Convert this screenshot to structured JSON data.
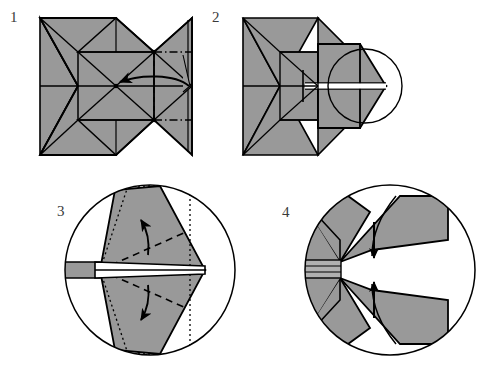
{
  "document": {
    "title": "Origami folding instruction diagram",
    "type": "step-by-step fold sequence",
    "panel_count": 4,
    "width": 485,
    "height": 370,
    "background_color": "#ffffff"
  },
  "colors": {
    "paper_gray": "#999999",
    "paper_gray_light": "#b0b0b0",
    "outline": "#000000",
    "label_text": "#3a3a3a",
    "white": "#ffffff"
  },
  "panels": [
    {
      "id": "panel-1",
      "number": "1",
      "label_x": 10,
      "label_y": 22,
      "caption": "Flat crease pattern of folded square grid with valley fold and arrow indicating fold to the left",
      "has_magnifier_circle": false,
      "annotations": {
        "valley_fold_vertical": "dashed vertical line",
        "dash_dot_lines": "two horizontal dash-dot fold lines on right",
        "arrow": "curved arrow pointing left"
      }
    },
    {
      "id": "panel-2",
      "number": "2",
      "label_x": 212,
      "label_y": 22,
      "caption": "Resulting collapsed form with circular magnifier highlighting the point",
      "has_magnifier_circle": true,
      "annotations": {
        "magnifier": "circle outlining the tip region to be enlarged in step 3"
      }
    },
    {
      "id": "panel-3",
      "number": "3",
      "label_x": 57,
      "label_y": 216,
      "caption": "Enlarged view inside circle; dotted square outline, dashed fold lines and two curved arrows opening the flaps outward",
      "has_magnifier_circle": true,
      "annotations": {
        "dotted_outline": "dotted square reference outline",
        "dashed_folds": "two dashed fold lines",
        "arrows": "two curved arrows, upper points up-left, lower points down-left"
      }
    },
    {
      "id": "panel-4",
      "number": "4",
      "label_x": 282,
      "label_y": 217,
      "caption": "Enlarged view after opening; two straight arrows pointing toward each other to close the flaps",
      "has_magnifier_circle": true,
      "annotations": {
        "arrows": "two straight arrows converging vertically toward the centre"
      }
    }
  ]
}
